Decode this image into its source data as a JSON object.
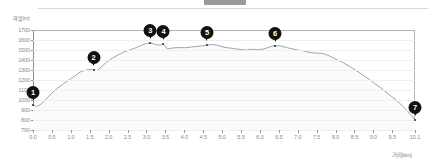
{
  "header": {
    "divider_present": true,
    "tab_handle": "scroll-handle"
  },
  "chart_data": {
    "type": "area",
    "title": "",
    "xlabel": "거리(km)",
    "ylabel": "해발(m)",
    "xlim": [
      0.0,
      10.1
    ],
    "ylim": [
      700,
      1700
    ],
    "grid": true,
    "legend": "none",
    "y_ticks": [
      1700,
      1600,
      1500,
      1400,
      1300,
      1200,
      1100,
      1000,
      900,
      800,
      700
    ],
    "x_ticks": [
      "0.0",
      "0.5",
      "1.0",
      "1.5",
      "2.0",
      "2.5",
      "3.0",
      "3.5",
      "4.0",
      "4.5",
      "5.0",
      "5.5",
      "6.0",
      "6.5",
      "7.0",
      "7.5",
      "8.0",
      "8.5",
      "9.0",
      "9.5",
      "10.1"
    ],
    "line_color": "#9a9a9a",
    "fill_color": "#fbfbfb",
    "series": [
      {
        "name": "elevation",
        "x": [
          0.0,
          0.1,
          0.22,
          0.35,
          0.5,
          0.65,
          0.8,
          0.95,
          1.1,
          1.25,
          1.4,
          1.5,
          1.6,
          1.7,
          1.8,
          1.95,
          2.1,
          2.25,
          2.4,
          2.55,
          2.7,
          2.85,
          3.0,
          3.1,
          3.2,
          3.3,
          3.4,
          3.45,
          3.55,
          3.7,
          3.85,
          4.0,
          4.15,
          4.3,
          4.45,
          4.6,
          4.75,
          4.9,
          5.05,
          5.2,
          5.35,
          5.5,
          5.65,
          5.8,
          5.95,
          6.1,
          6.25,
          6.4,
          6.55,
          6.7,
          6.85,
          7.0,
          7.15,
          7.3,
          7.45,
          7.6,
          7.75,
          7.9,
          8.05,
          8.2,
          8.4,
          8.6,
          8.8,
          9.0,
          9.2,
          9.4,
          9.6,
          9.8,
          9.95,
          10.1
        ],
        "y": [
          950,
          935,
          960,
          1010,
          1070,
          1120,
          1160,
          1200,
          1240,
          1280,
          1300,
          1305,
          1300,
          1295,
          1330,
          1380,
          1420,
          1450,
          1480,
          1500,
          1520,
          1545,
          1565,
          1570,
          1560,
          1550,
          1552,
          1558,
          1512,
          1520,
          1525,
          1522,
          1528,
          1535,
          1540,
          1548,
          1555,
          1545,
          1528,
          1520,
          1512,
          1505,
          1500,
          1508,
          1502,
          1510,
          1530,
          1545,
          1540,
          1525,
          1512,
          1500,
          1492,
          1478,
          1470,
          1468,
          1455,
          1430,
          1400,
          1375,
          1330,
          1280,
          1230,
          1175,
          1120,
          1060,
          1000,
          930,
          870,
          800
        ]
      }
    ],
    "waypoints": [
      {
        "id": "1",
        "label": "1",
        "x": 0.0,
        "y": 950
      },
      {
        "id": "2",
        "label": "2",
        "x": 1.6,
        "y": 1300
      },
      {
        "id": "3",
        "label": "3",
        "x": 3.1,
        "y": 1570
      },
      {
        "id": "4",
        "label": "4",
        "x": 3.45,
        "y": 1558
      },
      {
        "id": "5",
        "label": "5",
        "x": 4.6,
        "y": 1548
      },
      {
        "id": "6",
        "label": "6",
        "x": 6.4,
        "y": 1545
      },
      {
        "id": "7",
        "label": "7",
        "x": 10.1,
        "y": 800
      }
    ]
  }
}
